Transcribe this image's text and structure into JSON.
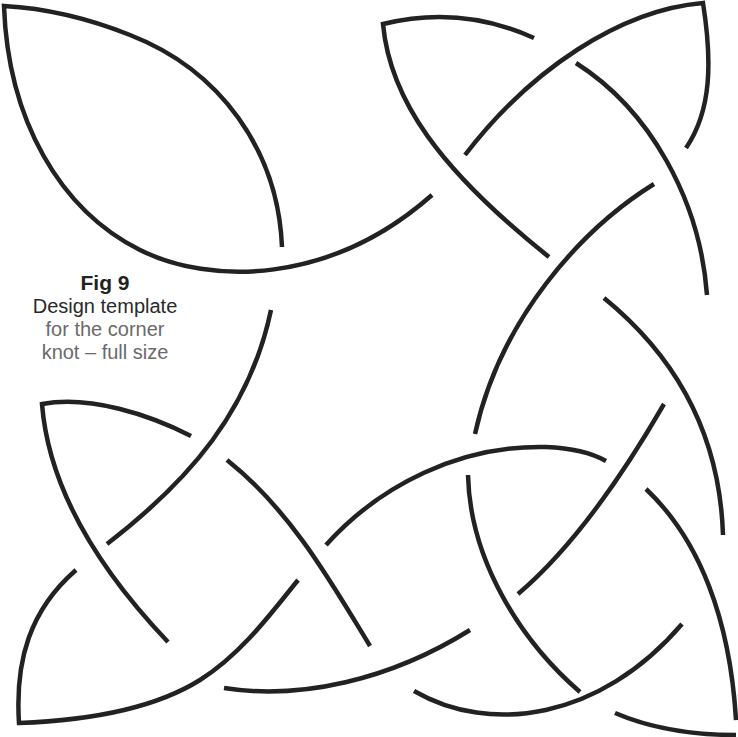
{
  "caption": {
    "figure_number": "Fig 9",
    "title": "Design template",
    "subtitle_line1": "for the corner",
    "subtitle_line2": "knot – full size"
  },
  "diagram": {
    "type": "celtic-corner-knot",
    "stroke_color": "#222222",
    "background_color": "#ffffff"
  }
}
